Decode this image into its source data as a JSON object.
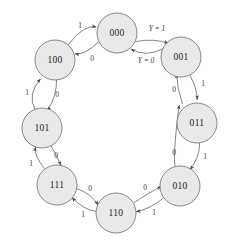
{
  "diagram": {
    "type": "state-transition-diagram",
    "title": "",
    "background_color": "#ffffff",
    "node_fill_color": "#e9e9e9",
    "node_stroke_color": "#7c7c7c",
    "edge_color": "#6e6e6e",
    "label_color": "#3a3a3a",
    "node_radius": 20,
    "states": [
      {
        "id": "s000",
        "label": "000",
        "cx": 117,
        "cy": 33
      },
      {
        "id": "s001",
        "label": "001",
        "cx": 181,
        "cy": 57
      },
      {
        "id": "s011",
        "label": "011",
        "cx": 197,
        "cy": 123
      },
      {
        "id": "s010",
        "label": "010",
        "cx": 180,
        "cy": 186
      },
      {
        "id": "s110",
        "label": "110",
        "cx": 116,
        "cy": 213
      },
      {
        "id": "s111",
        "label": "111",
        "cx": 57,
        "cy": 185
      },
      {
        "id": "s101",
        "label": "101",
        "cx": 42,
        "cy": 128
      },
      {
        "id": "s100",
        "label": "100",
        "cx": 55,
        "cy": 60
      }
    ],
    "transitions": [
      {
        "from": "000",
        "to": "001",
        "label": "Y = 1",
        "label_x": 157,
        "label_y": 28,
        "kind": "output"
      },
      {
        "from": "001",
        "to": "000",
        "label": "Y = 0",
        "label_x": 146,
        "label_y": 60,
        "kind": "output"
      },
      {
        "from": "001",
        "to": "011",
        "label": "1",
        "label_x": 203,
        "label_y": 83,
        "kind": "input"
      },
      {
        "from": "011",
        "to": "001",
        "label": "0",
        "label_x": 174,
        "label_y": 89,
        "kind": "input"
      },
      {
        "from": "011",
        "to": "010",
        "label": "1",
        "label_x": 205,
        "label_y": 156,
        "kind": "input"
      },
      {
        "from": "010",
        "to": "011",
        "label": "0",
        "label_x": 174,
        "label_y": 152,
        "kind": "input"
      },
      {
        "from": "010",
        "to": "110",
        "label": "1",
        "label_x": 154,
        "label_y": 212,
        "kind": "input"
      },
      {
        "from": "110",
        "to": "010",
        "label": "0",
        "label_x": 145,
        "label_y": 187,
        "kind": "input"
      },
      {
        "from": "110",
        "to": "111",
        "label": "1",
        "label_x": 83,
        "label_y": 214,
        "kind": "input"
      },
      {
        "from": "111",
        "to": "110",
        "label": "0",
        "label_x": 90,
        "label_y": 188,
        "kind": "input"
      },
      {
        "from": "111",
        "to": "101",
        "label": "1",
        "label_x": 31,
        "label_y": 163,
        "kind": "input"
      },
      {
        "from": "101",
        "to": "111",
        "label": "0",
        "label_x": 56,
        "label_y": 155,
        "kind": "input"
      },
      {
        "from": "101",
        "to": "100",
        "label": "1",
        "label_x": 27,
        "label_y": 92,
        "kind": "input"
      },
      {
        "from": "100",
        "to": "101",
        "label": "0",
        "label_x": 57,
        "label_y": 94,
        "kind": "input"
      },
      {
        "from": "100",
        "to": "000",
        "label": "1",
        "label_x": 80,
        "label_y": 25,
        "kind": "input"
      },
      {
        "from": "000",
        "to": "100",
        "label": "0",
        "label_x": 92,
        "label_y": 58,
        "kind": "input"
      }
    ]
  }
}
